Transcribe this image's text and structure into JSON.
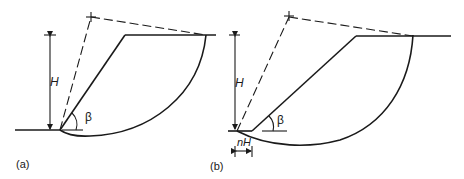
{
  "figure": {
    "panels": [
      {
        "id": "a",
        "label": "(a)",
        "height_label": "H",
        "angle_label": "β"
      },
      {
        "id": "b",
        "label": "(b)",
        "height_label": "H",
        "angle_label": "β",
        "offset_label": "nH"
      }
    ]
  }
}
